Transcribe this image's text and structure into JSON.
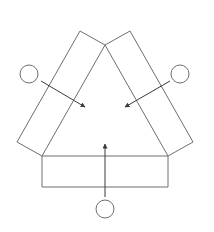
{
  "diagram": {
    "width": 214,
    "height": 232,
    "stroke": "#6e6e6e",
    "arrow_color": "#3a3a3a",
    "background": "#ffffff",
    "triangle": {
      "apex": [
        105,
        45
      ],
      "bottom_left": [
        42,
        156
      ],
      "bottom_right": [
        168,
        156
      ]
    },
    "panels": [
      {
        "name": "left-panel",
        "points": "80,31 105,45 42,156 17,142"
      },
      {
        "name": "right-panel",
        "points": "130,31 193,142 168,156 105,45"
      },
      {
        "name": "bottom-panel",
        "points": "42,156 168,156 168,187 42,187"
      }
    ],
    "nodes": [
      {
        "name": "left-node",
        "cx": 29,
        "cy": 74,
        "r": 9
      },
      {
        "name": "right-node",
        "cx": 180,
        "cy": 74,
        "r": 9
      },
      {
        "name": "bottom-node",
        "cx": 105,
        "cy": 209,
        "r": 9
      }
    ],
    "arrows": [
      {
        "name": "left-arrow",
        "x1": 41,
        "y1": 81,
        "x2": 85,
        "y2": 107
      },
      {
        "name": "right-arrow",
        "x1": 170,
        "y1": 81,
        "x2": 125,
        "y2": 107
      },
      {
        "name": "bottom-arrow",
        "x1": 105,
        "y1": 197,
        "x2": 105,
        "y2": 144
      }
    ]
  }
}
